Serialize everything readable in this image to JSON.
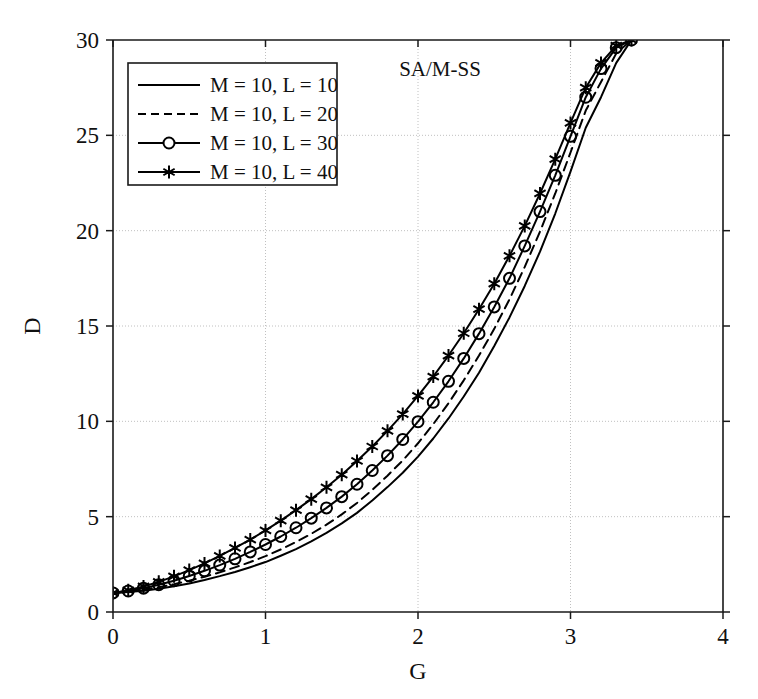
{
  "chart_data": {
    "type": "line",
    "title": "",
    "annotation": "SA/M-SS",
    "xlabel": "G",
    "ylabel": "D",
    "xlim": [
      0,
      4
    ],
    "ylim": [
      0,
      30
    ],
    "xticks": [
      0,
      1,
      2,
      3,
      4
    ],
    "yticks": [
      0,
      5,
      10,
      15,
      20,
      25,
      30
    ],
    "xticklabels": [
      "0",
      "1",
      "2",
      "3",
      "4"
    ],
    "yticklabels": [
      "0",
      "5",
      "10",
      "15",
      "20",
      "25",
      "30"
    ],
    "grid": true,
    "legend_position": "upper-left",
    "series": [
      {
        "name": "M = 10, L = 10",
        "style": "solid",
        "marker": "none",
        "x": [
          0.0,
          0.1,
          0.2,
          0.3,
          0.4,
          0.5,
          0.6,
          0.7,
          0.8,
          0.9,
          1.0,
          1.1,
          1.2,
          1.3,
          1.4,
          1.5,
          1.6,
          1.7,
          1.8,
          1.9,
          2.0,
          2.1,
          2.2,
          2.3,
          2.4,
          2.5,
          2.6,
          2.7,
          2.8,
          2.9,
          3.0,
          3.1,
          3.2,
          3.3,
          3.4
        ],
        "values": [
          1.0,
          1.05,
          1.12,
          1.22,
          1.35,
          1.5,
          1.68,
          1.88,
          2.1,
          2.35,
          2.62,
          2.95,
          3.3,
          3.7,
          4.15,
          4.65,
          5.2,
          5.85,
          6.55,
          7.3,
          8.15,
          9.1,
          10.15,
          11.3,
          12.55,
          13.95,
          15.45,
          17.1,
          18.9,
          20.9,
          23.1,
          25.4,
          27.0,
          28.8,
          30.0
        ]
      },
      {
        "name": "M = 10, L = 20",
        "style": "dashed",
        "marker": "none",
        "x": [
          0.0,
          0.1,
          0.2,
          0.3,
          0.4,
          0.5,
          0.6,
          0.7,
          0.8,
          0.9,
          1.0,
          1.1,
          1.2,
          1.3,
          1.4,
          1.5,
          1.6,
          1.7,
          1.8,
          1.9,
          2.0,
          2.1,
          2.2,
          2.3,
          2.4,
          2.5,
          2.6,
          2.7,
          2.8,
          2.9,
          3.0,
          3.1,
          3.2,
          3.3,
          3.4
        ],
        "values": [
          1.0,
          1.07,
          1.17,
          1.3,
          1.46,
          1.64,
          1.85,
          2.08,
          2.34,
          2.62,
          2.93,
          3.28,
          3.67,
          4.1,
          4.58,
          5.12,
          5.72,
          6.4,
          7.15,
          7.95,
          8.85,
          9.85,
          10.95,
          12.15,
          13.45,
          14.85,
          16.4,
          18.1,
          19.95,
          21.95,
          24.1,
          26.3,
          27.8,
          29.3,
          30.0
        ]
      },
      {
        "name": "M = 10, L = 30",
        "style": "solid",
        "marker": "circle",
        "x": [
          0.0,
          0.1,
          0.2,
          0.3,
          0.4,
          0.5,
          0.6,
          0.7,
          0.8,
          0.9,
          1.0,
          1.1,
          1.2,
          1.3,
          1.4,
          1.5,
          1.6,
          1.7,
          1.8,
          1.9,
          2.0,
          2.1,
          2.2,
          2.3,
          2.4,
          2.5,
          2.6,
          2.7,
          2.8,
          2.9,
          3.0,
          3.1,
          3.2,
          3.3,
          3.4
        ],
        "values": [
          1.0,
          1.1,
          1.25,
          1.43,
          1.64,
          1.89,
          2.16,
          2.46,
          2.79,
          3.15,
          3.54,
          3.96,
          4.42,
          4.92,
          5.46,
          6.05,
          6.7,
          7.42,
          8.2,
          9.05,
          9.98,
          11.0,
          12.1,
          13.3,
          14.6,
          16.0,
          17.5,
          19.2,
          21.0,
          22.9,
          24.95,
          27.0,
          28.5,
          29.6,
          30.0
        ]
      },
      {
        "name": "M = 10, L = 40",
        "style": "solid",
        "marker": "star",
        "x": [
          0.0,
          0.1,
          0.2,
          0.3,
          0.4,
          0.5,
          0.6,
          0.7,
          0.8,
          0.9,
          1.0,
          1.1,
          1.2,
          1.3,
          1.4,
          1.5,
          1.6,
          1.7,
          1.8,
          1.9,
          2.0,
          2.1,
          2.2,
          2.3,
          2.4,
          2.5,
          2.6,
          2.7,
          2.8,
          2.9,
          3.0,
          3.1,
          3.2,
          3.3,
          3.4
        ],
        "values": [
          1.0,
          1.14,
          1.34,
          1.58,
          1.87,
          2.2,
          2.55,
          2.94,
          3.36,
          3.8,
          4.28,
          4.79,
          5.34,
          5.92,
          6.54,
          7.2,
          7.92,
          8.68,
          9.5,
          10.38,
          11.33,
          12.35,
          13.45,
          14.62,
          15.88,
          17.22,
          18.68,
          20.25,
          21.95,
          23.75,
          25.65,
          27.5,
          28.8,
          29.7,
          30.0
        ]
      }
    ]
  },
  "legend": {
    "entries": [
      {
        "label": "M = 10, L = 10"
      },
      {
        "label": "M = 10, L = 20"
      },
      {
        "label": "M = 10, L = 30"
      },
      {
        "label": "M = 10, L = 40"
      }
    ]
  }
}
